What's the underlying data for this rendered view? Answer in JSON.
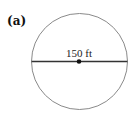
{
  "figure": {
    "panel_label": "(a)",
    "shape": "circle",
    "diameter_label": "150 ft",
    "colors": {
      "circle_stroke": "#8a8a8a",
      "diameter_line": "#333333",
      "center_dot": "#111111",
      "text": "#222222"
    }
  }
}
